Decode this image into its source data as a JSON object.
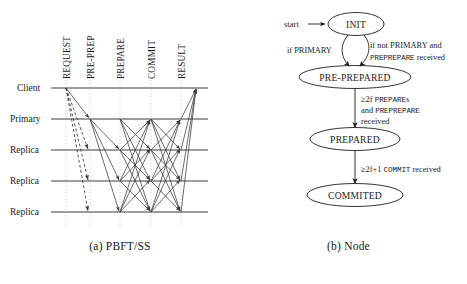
{
  "figure": {
    "panels": [
      {
        "id": "pbft-ss",
        "caption": "(a) PBFT/SS",
        "type": "message-sequence-diagram",
        "column_labels": [
          "REQUEST",
          "PRE-PREP",
          "PREPARE",
          "COMMIT",
          "RESULT"
        ],
        "row_labels": [
          "Client",
          "Primary",
          "Replica",
          "Replica",
          "Replica"
        ]
      },
      {
        "id": "node",
        "caption": "(b) Node",
        "type": "state-machine-diagram",
        "start_label": "start",
        "states": [
          "INIT",
          "PRE-PREPARED",
          "PREPARED",
          "COMMITED"
        ],
        "transitions": [
          {
            "from": "INIT",
            "to": "PRE-PREPARED",
            "label_lines": [
              [
                {
                  "text": "if PRIMARY",
                  "style": "serif"
                }
              ]
            ]
          },
          {
            "from": "INIT",
            "to": "PRE-PREPARED",
            "label_lines": [
              [
                {
                  "text": "if not ",
                  "style": "serif"
                },
                {
                  "text": "PRIMARY",
                  "style": "serif"
                },
                {
                  "text": " and",
                  "style": "serif"
                }
              ],
              [
                {
                  "text": "PREPREPARE",
                  "style": "mono"
                },
                {
                  "text": " received",
                  "style": "serif"
                }
              ]
            ]
          },
          {
            "from": "PRE-PREPARED",
            "to": "PREPARED",
            "label_lines": [
              [
                {
                  "text": "≥2f ",
                  "style": "serif"
                },
                {
                  "text": "PREPARE",
                  "style": "mono"
                },
                {
                  "text": "s",
                  "style": "serif"
                }
              ],
              [
                {
                  "text": "and ",
                  "style": "serif"
                },
                {
                  "text": "PREPREPARE",
                  "style": "mono"
                }
              ],
              [
                {
                  "text": "received",
                  "style": "serif"
                }
              ]
            ]
          },
          {
            "from": "PREPARED",
            "to": "COMMITED",
            "label_lines": [
              [
                {
                  "text": "≥2f+1 ",
                  "style": "serif"
                },
                {
                  "text": "COMMIT",
                  "style": "mono"
                },
                {
                  "text": " received",
                  "style": "serif"
                }
              ]
            ]
          }
        ]
      }
    ],
    "colors": {
      "ink": "#1c1c1c",
      "timeline": "#3c3c3c",
      "gridline": "#aaaaaa",
      "message": "#3a3a3a",
      "background": "#ffffff"
    }
  }
}
